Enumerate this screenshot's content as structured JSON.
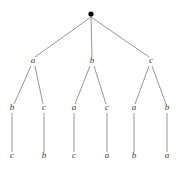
{
  "figure": {
    "type": "tree-diagram",
    "background_color": "#ffffff",
    "edge_color": "#8a8a8a",
    "label_color": "#3a3a3a",
    "root_color": "#000000"
  },
  "root": {
    "name": "root-node",
    "glyph": "filled-dot",
    "label": "",
    "x": 91,
    "y": 14,
    "radius": 2.6
  },
  "levels": {
    "level1_y": 63,
    "level2_y": 110,
    "level3_y": 158
  },
  "nodes": {
    "level1": [
      {
        "id": "n-a",
        "label": "a",
        "x": 33,
        "y": 63
      },
      {
        "id": "n-b",
        "label": "b",
        "x": 92,
        "y": 63
      },
      {
        "id": "n-c",
        "label": "c",
        "x": 151,
        "y": 63
      }
    ],
    "level2": [
      {
        "id": "n-a-b",
        "label": "b",
        "x": 12,
        "y": 110,
        "parent": "n-a"
      },
      {
        "id": "n-a-c",
        "label": "c",
        "x": 44,
        "y": 110,
        "parent": "n-a"
      },
      {
        "id": "n-b-a",
        "label": "a",
        "x": 74,
        "y": 110,
        "parent": "n-b"
      },
      {
        "id": "n-b-c",
        "label": "c",
        "x": 107,
        "y": 110,
        "parent": "n-b"
      },
      {
        "id": "n-c-a",
        "label": "a",
        "x": 134,
        "y": 110,
        "parent": "n-c"
      },
      {
        "id": "n-c-b",
        "label": "b",
        "x": 167,
        "y": 110,
        "parent": "n-c"
      }
    ],
    "level3": [
      {
        "id": "n-a-b-c",
        "label": "c",
        "x": 12,
        "y": 158,
        "parent": "n-a-b"
      },
      {
        "id": "n-a-c-b",
        "label": "b",
        "x": 44,
        "y": 158,
        "parent": "n-a-c"
      },
      {
        "id": "n-b-a-c",
        "label": "c",
        "x": 74,
        "y": 158,
        "parent": "n-b-a"
      },
      {
        "id": "n-b-c-a",
        "label": "a",
        "x": 107,
        "y": 158,
        "parent": "n-b-c"
      },
      {
        "id": "n-c-a-b",
        "label": "b",
        "x": 134,
        "y": 158,
        "parent": "n-c-a"
      },
      {
        "id": "n-c-b-a",
        "label": "a",
        "x": 167,
        "y": 158,
        "parent": "n-c-b"
      }
    ]
  },
  "edges": [
    {
      "id": "e-root-a",
      "from": "root",
      "to": "n-a",
      "x1": 91,
      "y1": 17,
      "x2": 35,
      "y2": 57
    },
    {
      "id": "e-root-b",
      "from": "root",
      "to": "n-b",
      "x1": 91,
      "y1": 17,
      "x2": 92,
      "y2": 57
    },
    {
      "id": "e-root-c",
      "from": "root",
      "to": "n-c",
      "x1": 91,
      "y1": 17,
      "x2": 149,
      "y2": 57
    },
    {
      "id": "e-a-b",
      "from": "n-a",
      "to": "n-a-b",
      "x1": 31,
      "y1": 66,
      "x2": 14,
      "y2": 104
    },
    {
      "id": "e-a-c",
      "from": "n-a",
      "to": "n-a-c",
      "x1": 35,
      "y1": 66,
      "x2": 43,
      "y2": 104
    },
    {
      "id": "e-b-a",
      "from": "n-b",
      "to": "n-b-a",
      "x1": 90,
      "y1": 66,
      "x2": 75,
      "y2": 104
    },
    {
      "id": "e-b-c",
      "from": "n-b",
      "to": "n-b-c",
      "x1": 94,
      "y1": 66,
      "x2": 106,
      "y2": 104
    },
    {
      "id": "e-c-a",
      "from": "n-c",
      "to": "n-c-a",
      "x1": 149,
      "y1": 66,
      "x2": 135,
      "y2": 104
    },
    {
      "id": "e-c-b",
      "from": "n-c",
      "to": "n-c-b",
      "x1": 152,
      "y1": 66,
      "x2": 166,
      "y2": 104
    },
    {
      "id": "e-ab-c",
      "from": "n-a-b",
      "to": "n-a-b-c",
      "x1": 12,
      "y1": 113,
      "x2": 12,
      "y2": 152
    },
    {
      "id": "e-ac-b",
      "from": "n-a-c",
      "to": "n-a-c-b",
      "x1": 44,
      "y1": 113,
      "x2": 44,
      "y2": 152
    },
    {
      "id": "e-ba-c",
      "from": "n-b-a",
      "to": "n-b-a-c",
      "x1": 74,
      "y1": 113,
      "x2": 74,
      "y2": 152
    },
    {
      "id": "e-bc-a",
      "from": "n-b-c",
      "to": "n-b-c-a",
      "x1": 107,
      "y1": 113,
      "x2": 107,
      "y2": 152
    },
    {
      "id": "e-ca-b",
      "from": "n-c-a",
      "to": "n-c-a-b",
      "x1": 134,
      "y1": 113,
      "x2": 134,
      "y2": 152
    },
    {
      "id": "e-cb-a",
      "from": "n-c-b",
      "to": "n-c-b-a",
      "x1": 167,
      "y1": 113,
      "x2": 167,
      "y2": 152
    }
  ]
}
